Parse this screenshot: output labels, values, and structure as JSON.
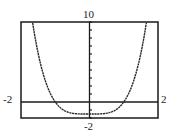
{
  "chart_data": {
    "type": "line",
    "title": "",
    "xlabel": "",
    "ylabel": "",
    "xlim": [
      -2,
      2
    ],
    "ylim": [
      -2,
      10
    ],
    "y_tick_step": 1,
    "grid": false,
    "legend": null,
    "window_labels": {
      "xmin": "-2",
      "xmax": "2",
      "ymin": "-2",
      "ymax": "10"
    },
    "series": [
      {
        "name": "f(x)",
        "approx_function": "y = 1.5x^4 - 1.5",
        "x": [
          -1.66,
          -1.5,
          -1.25,
          -1.0,
          -0.75,
          -0.5,
          -0.25,
          0,
          0.25,
          0.5,
          0.75,
          1.0,
          1.25,
          1.5,
          1.66
        ],
        "y": [
          9.9,
          6.09,
          2.16,
          0.0,
          -1.03,
          -1.41,
          -1.49,
          -1.5,
          -1.49,
          -1.41,
          -1.03,
          0.0,
          2.16,
          6.09,
          9.9
        ]
      }
    ],
    "annotations": {
      "roots": [
        -1,
        1
      ],
      "minimum": [
        0,
        -1.5
      ]
    }
  },
  "colors": {
    "curve": "#2a2a2a",
    "axes": "#1a1a1a",
    "frame": "#1a1a1a",
    "background": "#ffffff"
  }
}
